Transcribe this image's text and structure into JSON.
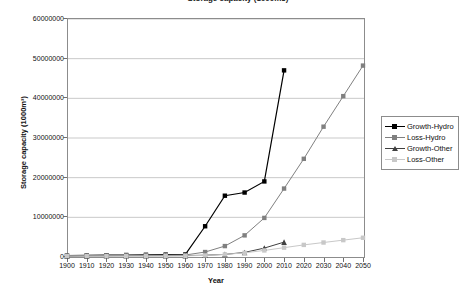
{
  "chart": {
    "title": "Storage capacity (1000m3)",
    "xlabel": "Year",
    "ylabel": "Storage capacity (1000m³)"
  },
  "legend": {
    "position": "right",
    "items": [
      {
        "label": "Growth-Hydro",
        "color": "#000000",
        "marker": "square"
      },
      {
        "label": "Loss-Hydro",
        "color": "#808080",
        "marker": "square"
      },
      {
        "label": "Growth-Other",
        "color": "#404040",
        "marker": "triangle"
      },
      {
        "label": "Loss-Other",
        "color": "#c8c8c8",
        "marker": "square"
      }
    ]
  },
  "axes": {
    "y_ticks": [
      "0",
      "10000000",
      "20000000",
      "30000000",
      "40000000",
      "50000000",
      "60000000"
    ],
    "x_ticks": [
      "1900",
      "1910",
      "1920",
      "1930",
      "1940",
      "1950",
      "1960",
      "1970",
      "1980",
      "1990",
      "2000",
      "2010",
      "2020",
      "2030",
      "2040",
      "2050"
    ]
  },
  "chart_data": {
    "type": "line",
    "title": "Storage capacity (1000m3)",
    "xlabel": "Year",
    "ylabel": "Storage capacity (1000m³)",
    "xlim": [
      1900,
      2050
    ],
    "ylim": [
      0,
      60000000
    ],
    "grid": true,
    "legend_position": "right",
    "x": [
      1900,
      1910,
      1920,
      1930,
      1940,
      1950,
      1960,
      1970,
      1980,
      1990,
      2000,
      2010,
      2020,
      2030,
      2040,
      2050
    ],
    "series": [
      {
        "name": "Growth-Hydro",
        "color": "#000000",
        "marker": "square",
        "values": [
          100000,
          150000,
          200000,
          250000,
          300000,
          350000,
          400000,
          7500000,
          15200000,
          16000000,
          18800000,
          46800000,
          null,
          null,
          null,
          null
        ]
      },
      {
        "name": "Loss-Hydro",
        "color": "#808080",
        "marker": "square",
        "values": [
          50000,
          80000,
          100000,
          130000,
          160000,
          200000,
          250000,
          1000000,
          2500000,
          5200000,
          9600000,
          17000000,
          24500000,
          32600000,
          40300000,
          48000000
        ]
      },
      {
        "name": "Growth-Other",
        "color": "#404040",
        "marker": "triangle",
        "values": [
          30000,
          40000,
          50000,
          60000,
          70000,
          80000,
          100000,
          200000,
          400000,
          900000,
          2000000,
          3500000,
          null,
          null,
          null,
          null
        ]
      },
      {
        "name": "Loss-Other",
        "color": "#c8c8c8",
        "marker": "square",
        "values": [
          10000,
          15000,
          20000,
          25000,
          30000,
          40000,
          50000,
          150000,
          400000,
          800000,
          1400000,
          2100000,
          2800000,
          3400000,
          4000000,
          4600000
        ]
      }
    ]
  }
}
